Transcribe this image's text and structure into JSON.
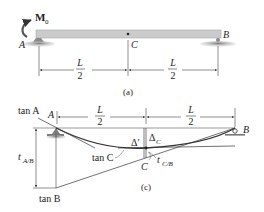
{
  "figure_a": {
    "moment_label": "M",
    "moment_sub": "0",
    "support_left": "A",
    "support_right": "B",
    "mid_point": "C",
    "dim_left_num": "L",
    "dim_left_den": "2",
    "dim_right_num": "L",
    "dim_right_den": "2",
    "caption": "(a)"
  },
  "figure_c": {
    "tan_a": "tan A",
    "point_a": "A",
    "point_b": "B",
    "dim_left_num": "L",
    "dim_left_den": "2",
    "dim_right_num": "L",
    "dim_right_den": "2",
    "t_ab": "t",
    "t_ab_sub": "A/B",
    "delta_prime": "Δ′",
    "delta_c": "Δ",
    "delta_c_sub": "C",
    "tan_c": "tan C",
    "point_c_prime": "C′",
    "point_c": "C",
    "t_cb": "t",
    "t_cb_sub": "C/B",
    "tan_b": "tan B",
    "caption": "(c)"
  },
  "colors": {
    "beam_fill": "#c8c8c8",
    "beam_edge": "#9a9a9a",
    "support_fill": "#8f8f8f",
    "line": "#333333",
    "text": "#222222"
  }
}
